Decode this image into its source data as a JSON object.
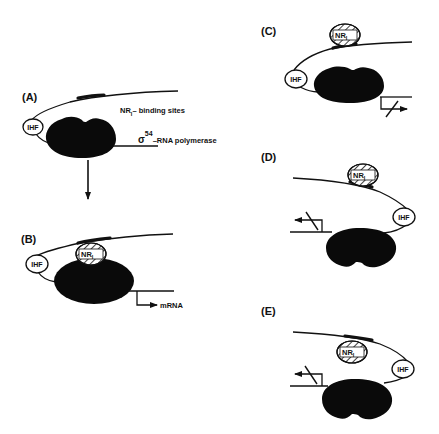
{
  "figure": {
    "panels": [
      {
        "id": "A",
        "label": "(A)",
        "ihf_label": "IHF",
        "annotations": {
          "binding_sites": "NR",
          "binding_sites_sub": "I",
          "binding_sites_rest": "– binding sites",
          "polymerase_sigma": "σ",
          "polymerase_sup": "54",
          "polymerase_rest": "–RNA polymerase"
        }
      },
      {
        "id": "B",
        "label": "(B)",
        "ihf_label": "IHF",
        "nri_label": "NR",
        "nri_sub": "I",
        "transcript_label": "mRNA"
      },
      {
        "id": "C",
        "label": "(C)",
        "ihf_label": "IHF",
        "nri_label": "NR",
        "nri_sub": "I",
        "transcription": "blocked"
      },
      {
        "id": "D",
        "label": "(D)",
        "ihf_label": "IHF",
        "nri_label": "NR",
        "nri_sub": "I",
        "transcription": "blocked"
      },
      {
        "id": "E",
        "label": "(E)",
        "ihf_label": "IHF",
        "nri_label": "NR",
        "nri_sub": "I",
        "transcription": "blocked"
      }
    ],
    "colors": {
      "ink": "#111111",
      "polymerase": "#0a0a0a",
      "background": "#ffffff"
    }
  }
}
